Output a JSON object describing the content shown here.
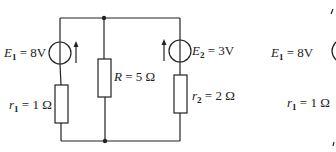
{
  "diagram": {
    "type": "circuit",
    "colors": {
      "stroke": "#222222",
      "background": "#ffffff"
    },
    "components": {
      "E1": {
        "symbol": "E",
        "subscript": "1",
        "value": "8V",
        "kind": "voltage-source",
        "arrow": "up"
      },
      "r1": {
        "symbol": "r",
        "subscript": "1",
        "value": "1 Ω",
        "kind": "resistor"
      },
      "R": {
        "symbol": "R",
        "subscript": "",
        "value": "5 Ω",
        "kind": "resistor"
      },
      "E2": {
        "symbol": "E",
        "subscript": "2",
        "value": "3V",
        "kind": "voltage-source",
        "arrow": "up"
      },
      "r2": {
        "symbol": "r",
        "subscript": "2",
        "value": "2 Ω",
        "kind": "resistor"
      }
    },
    "partial_right": {
      "E1": {
        "symbol": "E",
        "subscript": "1",
        "value": "8V"
      },
      "r1": {
        "symbol": "r",
        "subscript": "1",
        "value": "1 Ω"
      }
    },
    "equals": "="
  }
}
